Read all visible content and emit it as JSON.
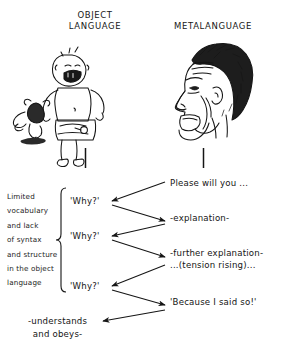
{
  "headers": {
    "left": "OBJECT\nLANGUAGE",
    "right": "METALANGUAGE"
  },
  "illustrations": {
    "left": "crying-toddler-with-teddy-bear-icon",
    "right": "adult-face-profile-icon"
  },
  "left_caption": "Limited\nvocabulary\nand lack\nof syntax\nand structure\nin the object\nlanguage",
  "child_turns": [
    {
      "label": "'Why?'"
    },
    {
      "label": "'Why?'"
    },
    {
      "label": "'Why?'"
    }
  ],
  "adult_turns": [
    {
      "label": "Please will you ..."
    },
    {
      "label": "-explanation-"
    },
    {
      "label": "-further explanation-\n...(tension rising)..."
    },
    {
      "label": "'Because I said so!'"
    }
  ],
  "conclusion": "-understands\nand obeys-",
  "colors": {
    "ink": "#141414",
    "background": "#ffffff"
  }
}
